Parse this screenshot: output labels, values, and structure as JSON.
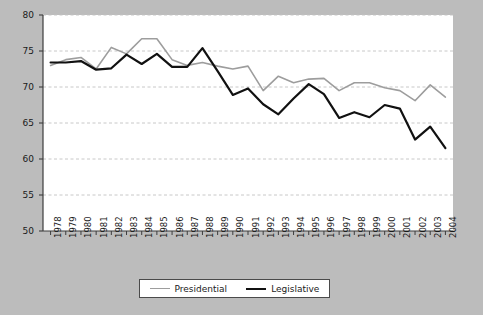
{
  "chart_data": {
    "type": "line",
    "title": "",
    "subtitle": "",
    "xlabel": "",
    "ylabel": "",
    "xlim": [
      1978,
      2004
    ],
    "ylim": [
      50,
      80
    ],
    "yticks": [
      50,
      55,
      60,
      65,
      70,
      75,
      80
    ],
    "grid": true,
    "grid_style": "dashed-horizontal",
    "legend_position": "bottom-center",
    "x": [
      1978,
      1979,
      1980,
      1981,
      1982,
      1983,
      1984,
      1985,
      1986,
      1987,
      1988,
      1989,
      1990,
      1991,
      1992,
      1993,
      1994,
      1995,
      1996,
      1997,
      1998,
      1999,
      2000,
      2001,
      2002,
      2003,
      2004
    ],
    "categories": [
      "1978",
      "1979",
      "1980",
      "1981",
      "1982",
      "1983",
      "1984",
      "1985",
      "1986",
      "1987",
      "1988",
      "1989",
      "1990",
      "1991",
      "1992",
      "1993",
      "1994",
      "1995",
      "1996",
      "1997",
      "1998",
      "1999",
      "2000",
      "2001",
      "2002",
      "2003",
      "2004"
    ],
    "series": [
      {
        "name": "Presidential",
        "color": "#9d9d9d",
        "width": 1.6,
        "values": [
          73.0,
          73.8,
          74.1,
          72.5,
          75.5,
          74.6,
          76.7,
          76.7,
          73.8,
          73.0,
          73.4,
          72.9,
          72.5,
          72.9,
          69.5,
          71.5,
          70.6,
          71.1,
          71.2,
          69.5,
          70.6,
          70.6,
          69.9,
          69.5,
          68.1,
          70.3,
          68.6
        ]
      },
      {
        "name": "Legislative",
        "color": "#111111",
        "width": 2.2,
        "values": [
          73.4,
          73.4,
          73.6,
          72.4,
          72.6,
          74.5,
          73.2,
          74.6,
          72.8,
          72.8,
          75.4,
          72.2,
          68.9,
          69.8,
          67.6,
          66.2,
          68.4,
          70.4,
          69.0,
          65.7,
          66.5,
          65.8,
          67.5,
          67.0,
          62.7,
          64.5,
          61.5
        ]
      }
    ]
  },
  "legend": {
    "entries": [
      {
        "label": "Presidential",
        "swatch": "presidential-line-swatch"
      },
      {
        "label": "Legislative",
        "swatch": "legislative-line-swatch"
      }
    ]
  }
}
